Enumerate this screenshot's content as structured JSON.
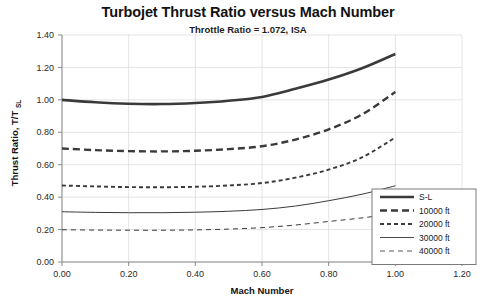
{
  "chart_data": {
    "type": "line",
    "title": "Turbojet Thrust Ratio versus Mach Number",
    "subtitle": "Throttle Ratio = 1.072, ISA",
    "xlabel": "Mach Number",
    "ylabel": "Thrust Ratio, T/T",
    "ylabel_sub": "SL",
    "xlim": [
      0.0,
      1.2
    ],
    "ylim": [
      0.0,
      1.4
    ],
    "xticks": [
      "0.00",
      "0.20",
      "0.40",
      "0.60",
      "0.80",
      "1.00",
      "1.20"
    ],
    "xtick_values": [
      0.0,
      0.2,
      0.4,
      0.6,
      0.8,
      1.0,
      1.2
    ],
    "yticks": [
      "0.00",
      "0.20",
      "0.40",
      "0.60",
      "0.80",
      "1.00",
      "1.20",
      "1.40"
    ],
    "ytick_values": [
      0.0,
      0.2,
      0.4,
      0.6,
      0.8,
      1.0,
      1.2,
      1.4
    ],
    "grid": true,
    "grid_axis": "both",
    "legend_position": "lower-right",
    "x": [
      0.0,
      0.1,
      0.2,
      0.3,
      0.4,
      0.5,
      0.6,
      0.7,
      0.8,
      0.9,
      1.0
    ],
    "series": [
      {
        "name": "S-L",
        "label": "S-L",
        "style": "solid",
        "width": 2.6,
        "color": "#3a3a3a",
        "values": [
          1.0,
          0.985,
          0.976,
          0.974,
          0.981,
          0.995,
          1.018,
          1.068,
          1.125,
          1.195,
          1.283
        ]
      },
      {
        "name": "10000 ft",
        "label": "10000 ft",
        "style": "dashed-thick",
        "width": 2.4,
        "color": "#3a3a3a",
        "values": [
          0.7,
          0.69,
          0.684,
          0.682,
          0.686,
          0.696,
          0.714,
          0.755,
          0.818,
          0.91,
          1.048
        ]
      },
      {
        "name": "20000 ft",
        "label": "20000 ft",
        "style": "dashed-medium",
        "width": 1.9,
        "color": "#3a3a3a",
        "values": [
          0.472,
          0.466,
          0.462,
          0.461,
          0.464,
          0.472,
          0.487,
          0.52,
          0.57,
          0.645,
          0.768
        ]
      },
      {
        "name": "30000 ft",
        "label": "30000 ft",
        "style": "solid-thin",
        "width": 1.0,
        "color": "#4a4a4a",
        "values": [
          0.31,
          0.306,
          0.304,
          0.304,
          0.307,
          0.313,
          0.324,
          0.345,
          0.378,
          0.418,
          0.47
        ]
      },
      {
        "name": "40000 ft",
        "label": "40000 ft",
        "style": "dashed-thin",
        "width": 1.0,
        "color": "#5a5a5a",
        "values": [
          0.199,
          0.197,
          0.196,
          0.196,
          0.198,
          0.203,
          0.212,
          0.228,
          0.25,
          0.272,
          0.299
        ]
      }
    ]
  }
}
